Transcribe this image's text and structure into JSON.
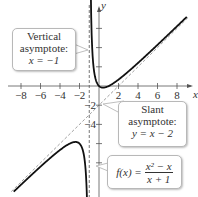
{
  "chart_data": {
    "type": "line",
    "title": "",
    "function": "f(x) = (x^2 - x)/(x + 1)",
    "xlabel": "x",
    "ylabel": "y",
    "xlim": [
      -9,
      9.5
    ],
    "ylim": [
      -11,
      8.5
    ],
    "x_ticks": [
      -8,
      -6,
      -4,
      -2,
      2,
      4,
      6,
      8
    ],
    "y_ticks": [
      -8,
      -6,
      -4,
      -2,
      2,
      4,
      6
    ],
    "y_tick_labels_shown": [
      -2,
      -4
    ],
    "grid": false,
    "series": [
      {
        "name": "f(x) right branch",
        "x": [
          -0.95,
          -0.9,
          -0.8,
          -0.6,
          -0.4,
          0,
          0.414,
          1,
          2,
          4,
          6,
          8,
          9
        ],
        "values": [
          38.03,
          17.1,
          7.2,
          2.4,
          0.93,
          0,
          -0.17,
          0,
          0.67,
          2.4,
          4.29,
          6.22,
          7.2
        ]
      },
      {
        "name": "f(x) left branch",
        "x": [
          -8.8,
          -8,
          -6,
          -4,
          -2.414,
          -2,
          -1.5,
          -1.2,
          -1.1
        ],
        "values": [
          -10.02,
          -10.29,
          -8.4,
          -6.67,
          -5.83,
          -6,
          -7.5,
          -13.2,
          -23.1
        ]
      },
      {
        "name": "Vertical asymptote",
        "style": "dashed",
        "x": [
          -1,
          -1
        ],
        "values": [
          -11,
          8.5
        ]
      },
      {
        "name": "Slant asymptote",
        "style": "dashed",
        "x": [
          -9,
          9
        ],
        "values": [
          -11,
          7
        ]
      }
    ],
    "annotations": [
      {
        "text": "Vertical asymptote: x = -1",
        "target": [
          -1,
          3.5
        ]
      },
      {
        "text": "Slant asymptote: y = x - 2",
        "target": [
          0.4,
          -1.8
        ]
      },
      {
        "text": "f(x) = (x^2 - x)/(x + 1)",
        "target": [
          -0.3,
          -8
        ]
      }
    ]
  },
  "axes": {
    "x_label": "x",
    "y_label": "y",
    "x_tick_labels": [
      "−8",
      "−6",
      "−4",
      "−2",
      "2",
      "4",
      "6",
      "8"
    ],
    "y_tick_labels": [
      "−2",
      "−4"
    ]
  },
  "callouts": {
    "vertical": {
      "line1": "Vertical",
      "line2": "asymptote:",
      "line3": "x = −1"
    },
    "slant": {
      "line1": "Slant",
      "line2": "asymptote:",
      "line3": "y = x − 2"
    },
    "func": {
      "lhs": "f(x) =",
      "num": "x² − x",
      "den": "x + 1"
    }
  }
}
